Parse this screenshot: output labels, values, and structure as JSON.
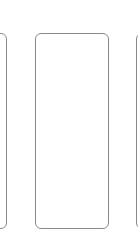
{
  "carousel": {
    "cards": [
      {
        "position": "left",
        "partial": true
      },
      {
        "position": "middle",
        "partial": false
      },
      {
        "position": "right",
        "partial": true
      }
    ],
    "border_color": "#8a8a8a",
    "background_color": "#ffffff"
  }
}
